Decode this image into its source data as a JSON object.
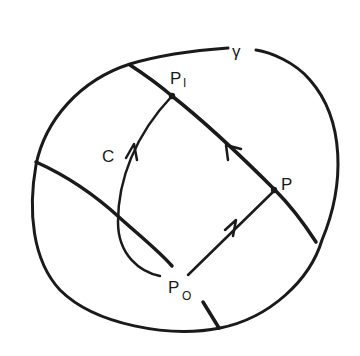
{
  "diagram": {
    "labels": {
      "gamma": "γ",
      "p1": "P",
      "p1_sub": "I",
      "c": "C",
      "p": "P",
      "p0": "P",
      "p0_sub": "O"
    },
    "colors": {
      "ink": "#1a1a1a",
      "background": "#ffffff"
    }
  }
}
